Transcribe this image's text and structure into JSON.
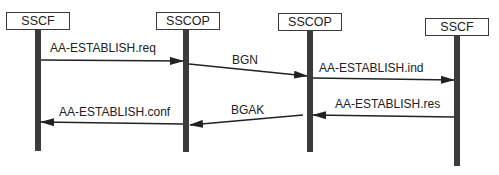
{
  "entities": [
    {
      "label": "SSCF",
      "x": 38
    },
    {
      "label": "SSCOP",
      "x": 186
    },
    {
      "label": "SSCOP",
      "x": 310
    },
    {
      "label": "SSCF",
      "x": 456
    }
  ],
  "messages": [
    {
      "label": "AA-ESTABLISH.req",
      "from": 0,
      "to": 1
    },
    {
      "label": "BGN",
      "from": 1,
      "to": 2
    },
    {
      "label": "AA-ESTABLISH.ind",
      "from": 2,
      "to": 3
    },
    {
      "label": "AA-ESTABLISH.res",
      "from": 3,
      "to": 2
    },
    {
      "label": "BGAK",
      "from": 2,
      "to": 1
    },
    {
      "label": "AA-ESTABLISH.conf",
      "from": 1,
      "to": 0
    }
  ],
  "colors": {
    "lifeline": "#3c3c3c",
    "arrow": "#222222"
  }
}
